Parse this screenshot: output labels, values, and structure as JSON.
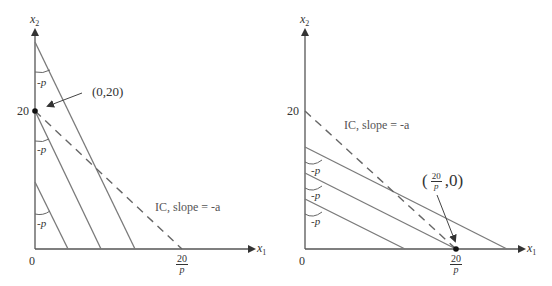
{
  "colors": {
    "line": "#7a7a7a",
    "axis": "#555555",
    "text": "#333333",
    "point": "#111111"
  },
  "left_panel": {
    "y_axis_label": "x",
    "y_axis_sub": "2",
    "x_axis_label": "x",
    "x_axis_sub": "1",
    "origin": "0",
    "y_tick": "20",
    "x_tick_num": "20",
    "x_tick_den": "p",
    "point_label": "(0,20)",
    "ic_label": "IC, slope = -a",
    "angle_labels": [
      "-p",
      "-p",
      "-p"
    ],
    "budget_lines": [
      {
        "from": [
          35,
          42
        ],
        "to": [
          135,
          249
        ]
      },
      {
        "from": [
          35,
          111
        ],
        "to": [
          101,
          249
        ]
      },
      {
        "from": [
          35,
          182
        ],
        "to": [
          68,
          249
        ]
      }
    ],
    "ic_line": {
      "from": [
        35,
        111
      ],
      "to": [
        182,
        249
      ]
    }
  },
  "right_panel": {
    "y_axis_label": "x",
    "y_axis_sub": "2",
    "x_axis_label": "x",
    "x_axis_sub": "1",
    "origin": "0",
    "y_tick": "20",
    "x_tick_num": "20",
    "x_tick_den": "p",
    "point_label_open": "(",
    "point_label_num": "20",
    "point_label_den": "p",
    "point_label_close": ",0)",
    "ic_label": "IC, slope = -a",
    "angle_labels": [
      "-p",
      "-p",
      "-p"
    ],
    "budget_lines": [
      {
        "from": [
          305,
          147
        ],
        "to": [
          507,
          249
        ]
      },
      {
        "from": [
          305,
          173
        ],
        "to": [
          456,
          249
        ]
      },
      {
        "from": [
          305,
          199
        ],
        "to": [
          405,
          249
        ]
      }
    ],
    "ic_line": {
      "from": [
        305,
        111
      ],
      "to": [
        456,
        249
      ]
    }
  }
}
